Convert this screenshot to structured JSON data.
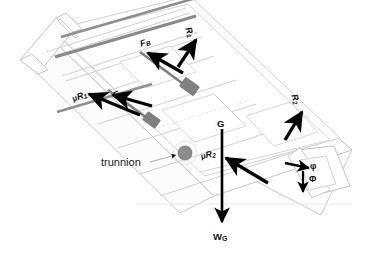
{
  "figure": {
    "type": "free-body-diagram",
    "background_color": "#ffffff",
    "body_outline_color": "#b9b9b9",
    "rail_color": "#8c8c8c",
    "slider_block_color": "#7f7f7f",
    "trunnion_color": "#8a8a8a",
    "arrow_color": "#000000",
    "leader_line_color": "#9a9a9a"
  },
  "labels": {
    "f_b": {
      "base": "F",
      "sub": "B",
      "text": "F B"
    },
    "r_1": {
      "base": "R",
      "sub": "1",
      "text": "R 1"
    },
    "mu_r_1": {
      "mu": "μ",
      "base": "R",
      "sub": "1",
      "text": "μR 1"
    },
    "f_t": {
      "base": "F",
      "sub": "T",
      "text": "F T"
    },
    "g": {
      "text": "G"
    },
    "mu_r_2": {
      "mu": "μ",
      "base": "R",
      "sub": "2",
      "text": "μR 2"
    },
    "r_2": {
      "base": "R",
      "sub": "2",
      "text": "R 2"
    },
    "w_g": {
      "base": "W",
      "sub": "G",
      "text": "W G"
    },
    "trunnion": {
      "text": "trunnion"
    },
    "phi_small": {
      "text": "φ"
    },
    "phi_cap": {
      "text": "Φ"
    }
  },
  "arrows": [
    {
      "name": "f-b-arrow",
      "label": "F B",
      "direction": "up-left",
      "meaning": "bearing friction force on upper slider"
    },
    {
      "name": "r-1-arrow",
      "label": "R 1",
      "direction": "up-right",
      "meaning": "normal reaction at upper bearing"
    },
    {
      "name": "mu-r-1-arrow",
      "label": "μR 1",
      "direction": "up-left",
      "meaning": "friction force at upper bearing"
    },
    {
      "name": "f-t-arrow",
      "label": "F T",
      "direction": "up-left",
      "meaning": "thrust force along rail"
    },
    {
      "name": "mu-r-2-arrow",
      "label": "μR 2",
      "direction": "up-left",
      "meaning": "friction force at lower bearing"
    },
    {
      "name": "r-2-arrow",
      "label": "R 2",
      "direction": "up-right",
      "meaning": "normal reaction at lower bearing"
    },
    {
      "name": "w-g-arrow",
      "label": "W G",
      "direction": "down",
      "meaning": "weight acting at centre of gravity G"
    },
    {
      "name": "phi-small-arrow",
      "label": "φ",
      "direction": "right",
      "meaning": "horizontal reference direction"
    },
    {
      "name": "phi-cap-arrow",
      "label": "Φ",
      "direction": "down",
      "meaning": "vertical reference direction"
    }
  ],
  "annotations": [
    {
      "name": "trunnion-callout",
      "text": "trunnion",
      "points_to": "pivot circle on the rail"
    }
  ]
}
